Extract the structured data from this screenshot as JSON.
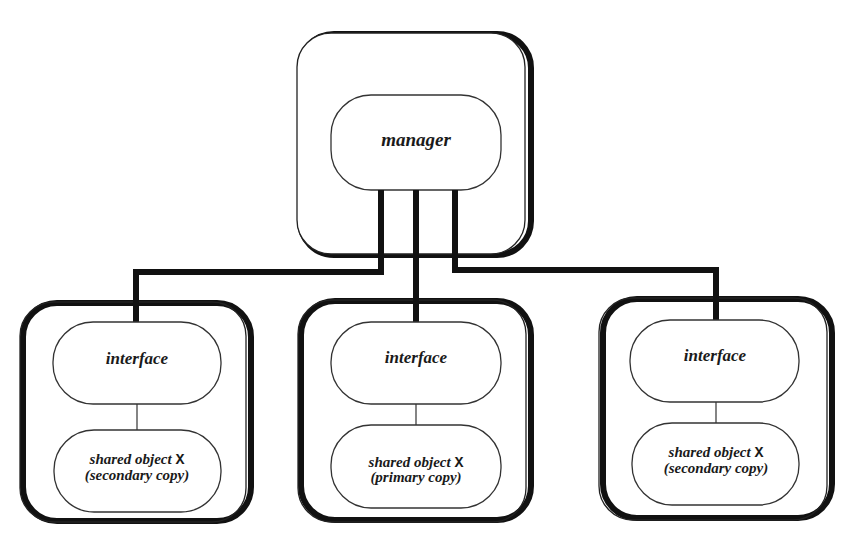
{
  "diagram": {
    "type": "block-diagram",
    "colors": {
      "line": "#111111",
      "background": "#ffffff",
      "text": "#1a1a1a"
    },
    "manager": {
      "label": "manager"
    },
    "nodes": [
      {
        "id": "left",
        "interface_label": "interface",
        "object_line1": "shared object ",
        "object_symbol": "X",
        "object_line2": "(secondary copy)"
      },
      {
        "id": "middle",
        "interface_label": "interface",
        "object_line1": "shared object ",
        "object_symbol": "X",
        "object_line2": "(primary copy)"
      },
      {
        "id": "right",
        "interface_label": "interface",
        "object_line1": "shared object ",
        "object_symbol": "X",
        "object_line2": "(secondary copy)"
      }
    ],
    "edges": [
      {
        "from": "manager",
        "to": "left.interface"
      },
      {
        "from": "manager",
        "to": "middle.interface"
      },
      {
        "from": "manager",
        "to": "right.interface"
      },
      {
        "from": "left.interface",
        "to": "left.shared_object"
      },
      {
        "from": "middle.interface",
        "to": "middle.shared_object"
      },
      {
        "from": "right.interface",
        "to": "right.shared_object"
      }
    ]
  }
}
